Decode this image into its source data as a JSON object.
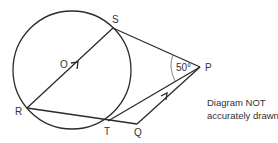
{
  "diagram": {
    "points": {
      "O": {
        "label": "O",
        "x": 72,
        "y": 70
      },
      "S": {
        "label": "S",
        "x": 113,
        "y": 28
      },
      "R": {
        "label": "R",
        "x": 27,
        "y": 108
      },
      "T": {
        "label": "T",
        "x": 108,
        "y": 121
      },
      "Q": {
        "label": "Q",
        "x": 137,
        "y": 124
      },
      "P": {
        "label": "P",
        "x": 200,
        "y": 67
      }
    },
    "circle": {
      "center": "O",
      "radius": 59
    },
    "segments": [
      "RS",
      "SP",
      "TP",
      "RQ",
      "QP"
    ],
    "parallel_marks": [
      "RS",
      "QP"
    ],
    "angle": {
      "vertex": "P",
      "between": [
        "S",
        "T"
      ],
      "label": "50°"
    },
    "note": {
      "line1": "Diagram NOT",
      "line2": "accurately drawn"
    }
  }
}
